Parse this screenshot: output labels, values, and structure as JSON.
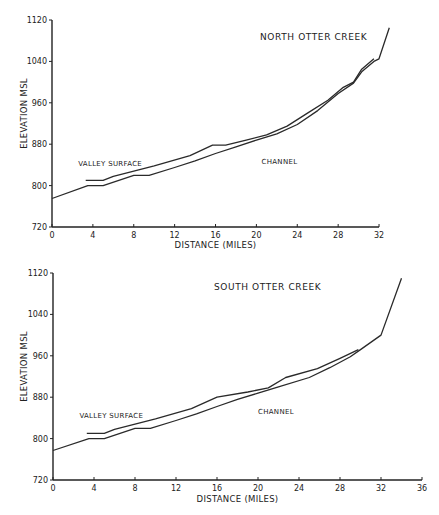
{
  "chart_data": [
    {
      "type": "line",
      "title": "NORTH OTTER CREEK",
      "xlabel": "DISTANCE (MILES)",
      "ylabel": "ELEVATION MSL",
      "xlim": [
        0,
        32
      ],
      "ylim": [
        720,
        1120
      ],
      "xticks": [
        0,
        4,
        8,
        12,
        16,
        20,
        24,
        28,
        32
      ],
      "yticks": [
        720,
        800,
        880,
        960,
        1040,
        1120
      ],
      "grid": false,
      "annotations": [
        {
          "text": "VALLEY SURFACE",
          "x": 5.5,
          "y": 838
        },
        {
          "text": "CHANNEL",
          "x": 20.5,
          "y": 842
        }
      ],
      "series": [
        {
          "name": "Valley Surface",
          "x": [
            3.3,
            5.0,
            6.0,
            8.0,
            10.0,
            13.5,
            15.7,
            17.0,
            19.0,
            21.0,
            23.0,
            25.0,
            27.0,
            28.5,
            29.5,
            30.3,
            31.5
          ],
          "y": [
            810,
            810,
            818,
            828,
            838,
            858,
            878,
            878,
            888,
            898,
            915,
            940,
            965,
            990,
            1000,
            1025,
            1045
          ]
        },
        {
          "name": "Channel",
          "x": [
            0,
            3.5,
            5.0,
            8.0,
            9.5,
            12.0,
            14.0,
            16.0,
            18.0,
            20.0,
            22.0,
            24.0,
            26.0,
            28.0,
            29.5,
            30.3,
            31.5,
            32.0,
            33.0
          ],
          "y": [
            775,
            800,
            800,
            820,
            820,
            835,
            848,
            862,
            875,
            888,
            900,
            918,
            945,
            978,
            998,
            1020,
            1040,
            1045,
            1105
          ]
        }
      ]
    },
    {
      "type": "line",
      "title": "SOUTH OTTER CREEK",
      "xlabel": "DISTANCE (MILES)",
      "ylabel": "ELEVATION MSL",
      "xlim": [
        0,
        36
      ],
      "ylim": [
        720,
        1120
      ],
      "xticks": [
        0,
        4,
        8,
        12,
        16,
        20,
        24,
        28,
        32,
        36
      ],
      "yticks": [
        720,
        800,
        880,
        960,
        1040,
        1120
      ],
      "grid": false,
      "annotations": [
        {
          "text": "VALLEY SURFACE",
          "x": 5.5,
          "y": 840
        },
        {
          "text": "CHANNEL",
          "x": 20,
          "y": 847
        }
      ],
      "series": [
        {
          "name": "Valley Surface",
          "x": [
            3.3,
            5.0,
            6.0,
            8.0,
            10.0,
            13.5,
            16.0,
            19.0,
            21.0,
            22.7,
            25.8,
            28.0,
            29.8
          ],
          "y": [
            810,
            810,
            818,
            828,
            838,
            858,
            880,
            890,
            898,
            918,
            935,
            955,
            972
          ],
          "stroke": "#222222"
        },
        {
          "name": "Channel",
          "x": [
            0,
            3.5,
            5.0,
            8.0,
            9.5,
            12.0,
            14.0,
            16.0,
            18.0,
            20.0,
            22.0,
            25.0,
            27.0,
            29.0,
            30.0,
            32.0,
            34.0
          ],
          "y": [
            777,
            800,
            800,
            820,
            820,
            835,
            848,
            862,
            876,
            888,
            900,
            918,
            937,
            958,
            972,
            1000,
            1110
          ]
        }
      ]
    }
  ]
}
